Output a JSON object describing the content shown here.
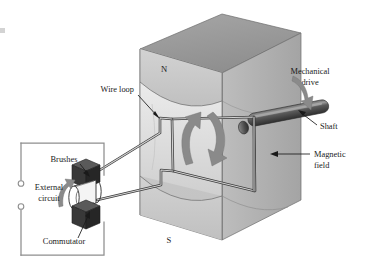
{
  "figure": {
    "background_color": "#ffffff"
  },
  "labels": {
    "north_pole": "N",
    "south_pole": "S",
    "wire_loop": "Wire loop",
    "mechanical_drive_line1": "Mechanical",
    "mechanical_drive_line2": "drive",
    "shaft": "Shaft",
    "magnetic_field_line1": "Magnetic",
    "magnetic_field_line2": "field",
    "brushes": "Brushes",
    "external_circuit_line1": "External",
    "external_circuit_line2": "circuit",
    "commutator": "Commutator"
  },
  "colors": {
    "magnet_top_face": "#9a9a9a",
    "magnet_front_face": "#c9c9c9",
    "magnet_side_face": "#b0b0b0",
    "magnet_bore_face": "#e0e0e0",
    "shaft_body": "#4a4a4a",
    "shaft_highlight": "#8c8c8c",
    "brush_block": "#3a3a3a",
    "commutator_body": "#ffffff",
    "rotation_arrow": "#8a8a8a",
    "circuit_wire": "#8e8e8e",
    "label_text": "#1a1a1a"
  },
  "parts": {
    "magnet": "permanent magnet with N pole on top and S pole on bottom",
    "loop": "rectangular wire loop rotating in the magnetic field",
    "shaft": "drive shaft entering from upper right",
    "commutator": "split-ring commutator with two brushes",
    "circuit": "external circuit with two open terminals"
  }
}
